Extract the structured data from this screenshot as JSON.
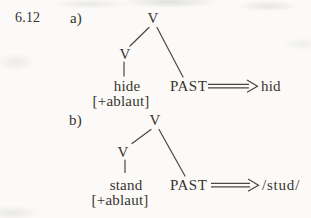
{
  "colors": {
    "paper": "#fbfaf8",
    "ink": "#37342e"
  },
  "figure": {
    "number": "6.12",
    "items": [
      {
        "label": "a)",
        "tree": {
          "root": "V",
          "child": "V",
          "leaf": "hide",
          "feature": "[+ablaut]",
          "past": "PAST"
        },
        "arrow_icon": "double-arrow-right-icon",
        "output": "hid"
      },
      {
        "label": "b)",
        "tree": {
          "root": "V",
          "child": "V",
          "leaf": "stand",
          "feature": "[+ablaut]",
          "past": "PAST"
        },
        "arrow_icon": "double-arrow-right-icon",
        "output": "/stud/"
      }
    ]
  }
}
